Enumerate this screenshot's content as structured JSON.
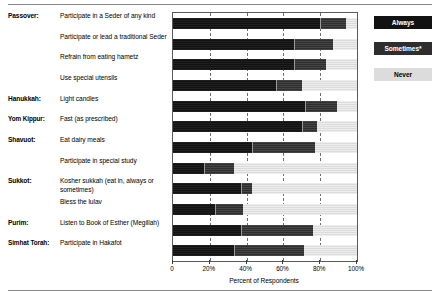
{
  "chart_data": {
    "type": "bar",
    "orientation": "horizontal",
    "stacked": true,
    "title": "",
    "xlabel": "Percent of Respondents",
    "ylabel": "",
    "xlim": [
      0,
      100
    ],
    "xticks": [
      0,
      20,
      40,
      60,
      80,
      100
    ],
    "xticklabels": [
      "0",
      "20%",
      "40%",
      "60%",
      "80%",
      "100%"
    ],
    "grid": true,
    "grid_axis": "x",
    "grid_style": "dashed",
    "legend_position": "right",
    "series": [
      {
        "name": "Always",
        "color": "#121212",
        "values": [
          80,
          66,
          66,
          56,
          72,
          70,
          43,
          17,
          37,
          23,
          37,
          33
        ]
      },
      {
        "name": "Sometimes*",
        "color": "#2e2e2e",
        "values": [
          14,
          21,
          17,
          14,
          17,
          8,
          34,
          16,
          6,
          15,
          39,
          38
        ]
      },
      {
        "name": "Never",
        "color": "#dcdcdc",
        "values": [
          6,
          13,
          17,
          30,
          11,
          22,
          23,
          67,
          57,
          62,
          24,
          29
        ]
      }
    ],
    "categories": [
      "Participate in a Seder of any kind",
      "Participate or lead a traditional Seder",
      "Refrain from eating hametz",
      "Use special utensils",
      "Light candles",
      "Fast (as prescribed)",
      "Eat dairy meals",
      "Participate in special study",
      "Kosher sukkah (eat in, always or sometimes)",
      "Bless the lulav",
      "Listen to Book of Esther (Megillah)",
      "Participate in Hakafot"
    ]
  },
  "rows": [
    {
      "holiday": "Passover:",
      "practice": "Participate in a Seder of any kind"
    },
    {
      "holiday": "",
      "practice": "Participate or lead a traditional Seder"
    },
    {
      "holiday": "",
      "practice": "Refrain from eating hametz"
    },
    {
      "holiday": "",
      "practice": "Use special utensils"
    },
    {
      "holiday": "Hanukkah:",
      "practice": "Light candles"
    },
    {
      "holiday": "Yom Kippur:",
      "practice": "Fast (as prescribed)"
    },
    {
      "holiday": "Shavuot:",
      "practice": "Eat dairy meals"
    },
    {
      "holiday": "",
      "practice": "Participate in special study"
    },
    {
      "holiday": "Sukkot:",
      "practice": "Kosher sukkah (eat in, always or sometimes)"
    },
    {
      "holiday": "",
      "practice": "Bless the lulav"
    },
    {
      "holiday": "Purim:",
      "practice": "Listen to Book of Esther (Megillah)"
    },
    {
      "holiday": "Simhat Torah:",
      "practice": "Participate in Hakafot"
    }
  ],
  "legend": {
    "always": "Always",
    "sometimes": "Sometimes*",
    "never": "Never"
  },
  "axis": {
    "xlabel": "Percent of Respondents",
    "ticklabels": [
      "0",
      "20%",
      "40%",
      "60%",
      "80%",
      "100%"
    ]
  }
}
